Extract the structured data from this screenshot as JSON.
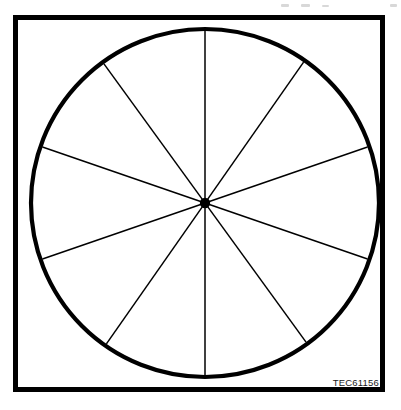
{
  "figure": {
    "reference_code": "TEC61156",
    "colors": {
      "stroke": "#000000",
      "background": "#ffffff",
      "frame": "#000000"
    },
    "frame": {
      "x": 13,
      "y": 15,
      "width": 372,
      "height": 377,
      "border_width": 5
    },
    "circle": {
      "center_x": 205,
      "center_y": 203,
      "radius": 174,
      "stroke_width": 4.2
    },
    "center_dot": {
      "radius": 5.2,
      "label": "center-point"
    },
    "spoke_stroke_width": 1.5,
    "sector_count": 10,
    "diameters": [
      {
        "name": "vertical-diameter",
        "angle_deg": 90,
        "opposite_deg": 270
      },
      {
        "name": "diameter-126-306",
        "angle_deg": 126,
        "opposite_deg": 306
      },
      {
        "name": "diameter-55-235",
        "angle_deg": 55,
        "opposite_deg": 235
      },
      {
        "name": "diameter-161-341",
        "angle_deg": 161,
        "opposite_deg": 341
      },
      {
        "name": "diameter-19-199",
        "angle_deg": 19,
        "opposite_deg": 199
      }
    ]
  },
  "chart_data": {
    "type": "pie",
    "title": "",
    "subtitle": "",
    "xlabel": "",
    "ylabel": "",
    "legend": [],
    "annotations": [
      "TEC61156"
    ],
    "grid": false,
    "categories": [
      "sector-1",
      "sector-2",
      "sector-3",
      "sector-4",
      "sector-5",
      "sector-6",
      "sector-7",
      "sector-8",
      "sector-9",
      "sector-10"
    ],
    "values": [
      10,
      10,
      10,
      10,
      10,
      10,
      10,
      10,
      10,
      10
    ],
    "boundary_angles_deg": [
      19,
      55,
      90,
      126,
      161,
      199,
      235,
      270,
      306,
      341
    ],
    "slice_fill": "#ffffff",
    "slice_stroke": "#000000"
  }
}
